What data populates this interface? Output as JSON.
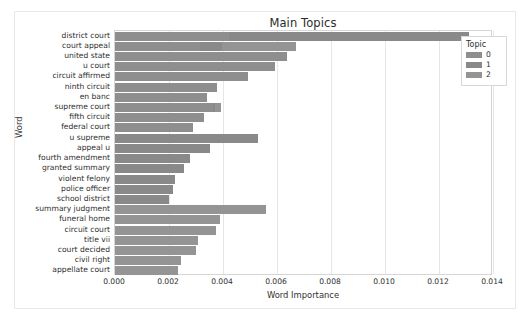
{
  "chart_data": {
    "type": "bar",
    "orientation": "horizontal",
    "stacked": true,
    "title": "Main Topics",
    "xlabel": "Word Importance",
    "ylabel": "Word",
    "xlim": [
      0.0,
      0.014
    ],
    "xticks": [
      "0.000",
      "0.002",
      "0.004",
      "0.006",
      "0.008",
      "0.010",
      "0.012",
      "0.014"
    ],
    "xtick_values": [
      0.0,
      0.002,
      0.004,
      0.006,
      0.008,
      0.01,
      0.012,
      0.014
    ],
    "grid": "vertical",
    "legend": {
      "title": "Topic",
      "position": "upper right",
      "entries": [
        {
          "label": "0",
          "color": "#8e8e8e"
        },
        {
          "label": "1",
          "color": "#898989"
        },
        {
          "label": "2",
          "color": "#949494"
        }
      ]
    },
    "categories": [
      "district court",
      "court appeal",
      "united state",
      "u court",
      "circuit affirmed",
      "ninth circuit",
      "en banc",
      "supreme court",
      "fifth circuit",
      "federal court",
      "u supreme",
      "appeal u",
      "fourth amendment",
      "granted summary",
      "violent felony",
      "police officer",
      "school district",
      "summary judgment",
      "funeral home",
      "circuit court",
      "title vii",
      "court decided",
      "civil right",
      "appellate court"
    ],
    "series": [
      {
        "name": "0",
        "color": "#8e8e8e",
        "values": [
          0.00424,
          0.00316,
          0.00636,
          0.00594,
          0.00493,
          0.00378,
          0.0034,
          0.00363,
          0.00328,
          0.00289,
          0.0,
          0.0,
          0.0,
          0.0,
          0.0,
          0.0,
          0.0,
          0.0,
          0.0,
          0.0,
          0.0,
          0.0,
          0.0,
          0.0
        ]
      },
      {
        "name": "1",
        "color": "#898989",
        "values": [
          0.00886,
          0.00081,
          0.0,
          0.0,
          0.0,
          0.0,
          0.0,
          8e-05,
          0.0,
          0.0,
          0.00528,
          0.00351,
          0.00278,
          0.00255,
          0.00224,
          0.00216,
          0.00201,
          0.0,
          0.0,
          0.0,
          0.0,
          0.0,
          0.0,
          0.0
        ]
      },
      {
        "name": "2",
        "color": "#949494",
        "values": [
          0.0,
          0.00274,
          0.0,
          0.0,
          0.0,
          0.0,
          0.0,
          0.00022,
          0.0,
          0.0,
          0.0,
          0.0,
          0.0,
          0.0,
          0.0,
          0.0,
          0.0,
          0.00559,
          0.0039,
          0.00374,
          0.00309,
          0.00301,
          0.00243,
          0.00235
        ]
      }
    ],
    "totals": [
      0.0131,
      0.00671,
      0.00636,
      0.00594,
      0.00493,
      0.00378,
      0.0034,
      0.00393,
      0.00328,
      0.00289,
      0.00528,
      0.00351,
      0.00278,
      0.00255,
      0.00224,
      0.00216,
      0.00201,
      0.00559,
      0.0039,
      0.00374,
      0.00309,
      0.00301,
      0.00243,
      0.00235
    ]
  }
}
